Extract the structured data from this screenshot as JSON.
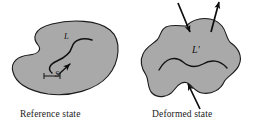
{
  "figure": {
    "background_color": "#ffffff",
    "body_fill_color": "#a9a9a9",
    "body_outline_color": "#1a1a1a",
    "ink_color": "#111111"
  },
  "captions": {
    "reference": "Reference state",
    "deformed": "Deformed state"
  },
  "labels": {
    "line_reference": "L",
    "segment_reference": "S",
    "line_deformed": "L'"
  },
  "shapes": [
    {
      "name": "reference-body",
      "state": "reference",
      "description": "kidney/bean shaped gray region with concave notch on the left side",
      "fill": "#a9a9a9"
    },
    {
      "name": "deformed-body",
      "state": "deformed",
      "description": "lumpy irregular gray region with rounded lobes",
      "fill": "#a9a9a9"
    }
  ],
  "curves": [
    {
      "name": "material-line-L",
      "label": "L",
      "description": "S-shaped material curve inside the reference body, with arrowhead indicating direction",
      "has_arrowhead": true
    },
    {
      "name": "segment-S",
      "label": "S",
      "description": "short bracketed segment marking an element of arc length along L",
      "has_arrowhead": false
    },
    {
      "name": "material-line-L-prime",
      "label": "L'",
      "description": "wavy material curve inside the deformed body (image of L)",
      "has_arrowhead": false
    }
  ],
  "arrows": [
    {
      "name": "traction-arrow-top-left",
      "direction": "inward",
      "points": "down and slightly right onto the upper boundary"
    },
    {
      "name": "traction-arrow-top-right",
      "direction": "outward",
      "points": "up and slightly right away from the upper boundary"
    },
    {
      "name": "traction-arrow-bottom",
      "direction": "inward",
      "points": "up and slightly left onto the lower boundary"
    }
  ]
}
